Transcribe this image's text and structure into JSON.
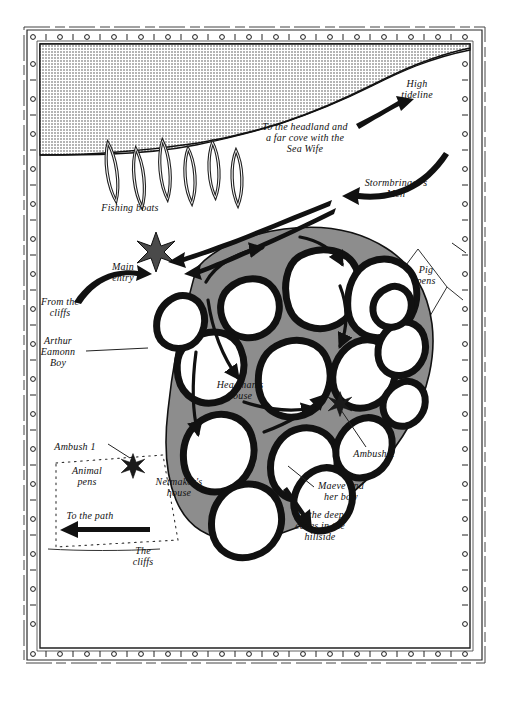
{
  "map": {
    "title": "Fishing village raid map",
    "style": "hand-drawn pen-and-ink fantasy map with riveted decorative border",
    "colors": {
      "ink": "#111111",
      "paper": "#ffffff",
      "sea_halftone": "#c9c9c9",
      "village_ground": "#8d8d8d",
      "border_ink": "#1a1a1a"
    },
    "regions": {
      "sea": {
        "name": "sea",
        "fill": "sea_halftone",
        "note": "upper area above the shoreline"
      },
      "shore": {
        "name": "beach-and-land",
        "fill": "paper"
      },
      "village": {
        "name": "village-compound",
        "fill": "village_ground",
        "note": "oval walled settlement of round huts"
      }
    }
  },
  "labels": [
    {
      "id": "high-tideline",
      "text": "High\ntideline",
      "x": 417,
      "y": 84,
      "align": "center",
      "size": "s10"
    },
    {
      "id": "to-the-headland",
      "text": "To the headland and\na far cove with the\nSea Wife",
      "x": 305,
      "y": 128,
      "align": "center",
      "size": "s10"
    },
    {
      "id": "stormbringers-men",
      "text": "Stormbringer's\nMen",
      "x": 396,
      "y": 185,
      "align": "center",
      "size": "s10"
    },
    {
      "id": "fishing-boats",
      "text": "Fishing boats",
      "x": 130,
      "y": 207,
      "align": "center",
      "size": "s10"
    },
    {
      "id": "main-entry",
      "text": "Main\nentry",
      "x": 122,
      "y": 268,
      "align": "center",
      "size": "s10"
    },
    {
      "id": "from-the-cliffs",
      "text": "From the\ncliffs",
      "x": 60,
      "y": 303,
      "align": "center",
      "size": "s10"
    },
    {
      "id": "arthur-eamonn-boy",
      "text": "Arthur\nEamonn\nBoy",
      "x": 58,
      "y": 348,
      "align": "center",
      "size": "s10"
    },
    {
      "id": "pig-pens",
      "text": "Pig\npens",
      "x": 426,
      "y": 271,
      "align": "center",
      "size": "s10"
    },
    {
      "id": "headmans-house",
      "text": "Headman's\nhouse",
      "x": 240,
      "y": 386,
      "align": "center",
      "size": "s10"
    },
    {
      "id": "ambush-1",
      "text": "Ambush 1",
      "x": 75,
      "y": 447,
      "align": "center",
      "size": "s10"
    },
    {
      "id": "ambush-2",
      "text": "Ambush 2",
      "x": 374,
      "y": 454,
      "align": "center",
      "size": "s10"
    },
    {
      "id": "animal-pens",
      "text": "Animal\npens",
      "x": 87,
      "y": 472,
      "align": "center",
      "size": "s10"
    },
    {
      "id": "netmakers-house",
      "text": "Netmaker's\nhouse",
      "x": 179,
      "y": 483,
      "align": "center",
      "size": "s10"
    },
    {
      "id": "maeve-and-her-bow",
      "text": "Maeve and\nher bow",
      "x": 341,
      "y": 487,
      "align": "center",
      "size": "s10"
    },
    {
      "id": "to-the-path",
      "text": "To the path",
      "x": 90,
      "y": 516,
      "align": "center",
      "size": "s10"
    },
    {
      "id": "to-the-deep-caves",
      "text": "To the deep\ncaves in the\nhillside",
      "x": 320,
      "y": 516,
      "align": "center",
      "size": "s10"
    },
    {
      "id": "the-cliffs",
      "text": "The\ncliffs",
      "x": 143,
      "y": 552,
      "align": "center",
      "size": "s10"
    }
  ],
  "features": {
    "fishing_boats": {
      "name": "fishing-boats",
      "count": 6,
      "shape": "pointed-oval hulls drawn in outline along the beach"
    },
    "huts": {
      "name": "village-huts",
      "count": 15,
      "shape": "rounded irregular rings with heavy black walls and white interiors"
    },
    "ambush_markers": {
      "name": "ambush-starburst",
      "count": 2,
      "shape": "eight-pointed black star"
    },
    "main_entry_marker": {
      "name": "main-entry-starburst",
      "count": 1,
      "shape": "eight-pointed star at the village gate"
    },
    "animal_pens_fence": {
      "name": "animal-pens-fence",
      "shape": "dotted post-and-rail rectangle"
    },
    "pig_pens_fence": {
      "name": "pig-pens-fence",
      "shape": "thin-line kite/diamond enclosure"
    },
    "arrows": [
      {
        "name": "arrow-high-tideline",
        "note": "points up-right along the tideline"
      },
      {
        "name": "arrow-stormbringers",
        "note": "long sweeping arrow from the right edge toward the village"
      },
      {
        "name": "arrow-approach-beach",
        "note": "arrow running down the shore to the main entry star"
      },
      {
        "name": "arrow-from-the-cliffs",
        "note": "arrow curving up to the main entry"
      },
      {
        "name": "arrow-village-lanes",
        "note": "several small arrows threading the lanes between huts"
      },
      {
        "name": "arrow-to-the-path",
        "note": "arrow pointing left out of the animal pens"
      },
      {
        "name": "arrow-to-deep-caves",
        "note": "arrow pointing down-right to the hillside caves"
      }
    ]
  },
  "border": {
    "name": "decorative-riveted-frame",
    "description": "double-ruled rectangular frame with evenly spaced circular rivets",
    "rivets_top": 16,
    "rivets_side": 18
  }
}
